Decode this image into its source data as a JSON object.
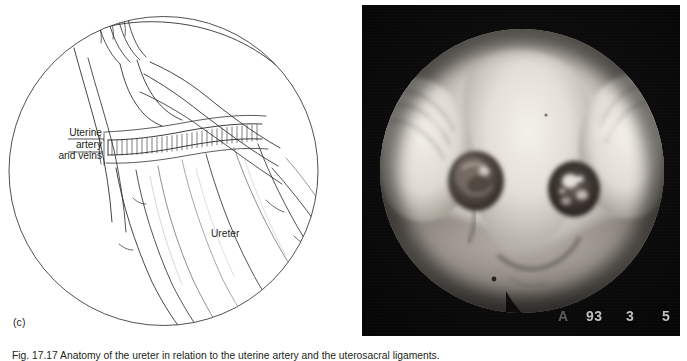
{
  "figure": {
    "panels": [
      {
        "id": "c",
        "type": "line-diagram",
        "panel_label": "(c)",
        "labels": [
          {
            "name": "uterine-vessels",
            "text": "Uterine\nartery\nand veins",
            "lines": [
              "Uterine",
              "artery",
              "and veins"
            ]
          },
          {
            "name": "ureter",
            "text": "Ureter",
            "lines": [
              "Ureter"
            ]
          }
        ]
      },
      {
        "id": "photo",
        "type": "endoscopic-photograph",
        "overlay_stamp": {
          "full": "A 93 3 5",
          "letter": "A",
          "year": "93",
          "month": "3",
          "day": "5"
        }
      }
    ],
    "caption": "Fig. 17.17 Anatomy of the ureter in relation to the uterine artery and the uterosacral ligaments."
  },
  "labels": {
    "uterine_line1": "Uterine",
    "uterine_line2": "artery",
    "uterine_line3": "and veins",
    "ureter": "Ureter",
    "panel_c": "(c)"
  },
  "stamp": {
    "letter": "A",
    "year": "93",
    "month": "3",
    "day": "5"
  },
  "colors": {
    "ink": "#231f20",
    "paper": "#ffffff",
    "photo_background": "#000000",
    "stamp_text": "#d9d9d9",
    "tissue_highlight": "#e8e4dc",
    "tissue_mid": "#9a948c",
    "tissue_shadow": "#3a3733"
  },
  "caption_text": "Fig. 17.17 Anatomy of the ureter in relation to the uterine artery and the uterosacral ligaments."
}
